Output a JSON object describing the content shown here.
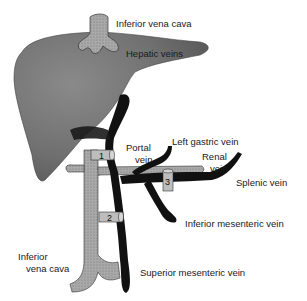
{
  "diagram": {
    "type": "anatomical",
    "labels": {
      "ivc_top": "Inferior vena cava",
      "hepatic_veins": "Hepatic veins",
      "portal_vein_1": "Portal",
      "portal_vein_2": "vein",
      "left_gastric": "Left gastric vein",
      "renal_1": "Renal",
      "renal_2": "vein",
      "splenic": "Splenic vein",
      "inferior_mesenteric": "Inferior mesenteric vein",
      "ivc_bottom_1": "Inferior",
      "ivc_bottom_2": "vena cava",
      "superior_mesenteric": "Superior mesenteric vein"
    },
    "shunt_markers": [
      "1",
      "2",
      "3"
    ],
    "colors": {
      "liver": "#7a7a7a",
      "ivc": "#a8a8a8",
      "portal_system": "#111111",
      "background": "#ffffff"
    }
  }
}
